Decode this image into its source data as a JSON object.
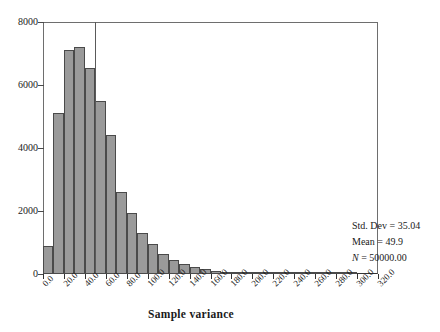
{
  "chart_data": {
    "type": "bar",
    "title": "",
    "subtitle": "",
    "xlabel": "Sample variance",
    "ylabel": "",
    "xlim": [
      0,
      320
    ],
    "ylim": [
      0,
      8000
    ],
    "grid": false,
    "legend_position": "none",
    "bin_width": 10,
    "x_tick_labels": [
      "0.0",
      "20.0",
      "40.0",
      "60.0",
      "80.0",
      "100.0",
      "120.0",
      "140.0",
      "160.0",
      "180.0",
      "200.0",
      "220.0",
      "240.0",
      "260.0",
      "280.0",
      "300.0",
      "320.0"
    ],
    "x_tick_values": [
      0,
      20,
      40,
      60,
      80,
      100,
      120,
      140,
      160,
      180,
      200,
      220,
      240,
      260,
      280,
      300,
      320
    ],
    "y_tick_labels": [
      "0",
      "2000",
      "4000",
      "6000",
      "8000"
    ],
    "y_tick_values": [
      0,
      2000,
      4000,
      6000,
      8000
    ],
    "bin_centers": [
      5,
      15,
      25,
      35,
      45,
      55,
      65,
      75,
      85,
      95,
      105,
      115,
      125,
      135,
      145,
      155,
      165,
      175,
      185,
      195,
      205,
      215,
      225,
      235,
      245,
      255,
      265,
      275,
      285,
      295,
      305,
      315
    ],
    "values": [
      900,
      5100,
      7100,
      7200,
      6550,
      5500,
      4400,
      2600,
      1950,
      1300,
      950,
      650,
      450,
      310,
      220,
      150,
      100,
      70,
      50,
      35,
      25,
      18,
      12,
      8,
      5,
      4,
      3,
      2,
      1,
      1,
      0,
      0
    ],
    "reference_line": {
      "name": "mean-reference-line",
      "orientation": "vertical",
      "x": 49.9
    },
    "annotations": {
      "std_dev": "Std. Dev = 35.04",
      "mean": "Mean = 49.9",
      "n_prefix": "N",
      "n_rest": " = 50000.00"
    },
    "colors": {
      "bar_fill": "#9a9a9a",
      "bar_edge": "#4a4a4a",
      "axis": "#333333",
      "reference_line": "#5a5a5a",
      "text": "#1a1a1a",
      "background": "#ffffff"
    }
  }
}
